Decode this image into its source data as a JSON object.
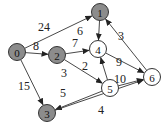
{
  "graph": {
    "nodes": [
      {
        "id": "0",
        "label": "0",
        "x": 17,
        "y": 52,
        "shaded": true
      },
      {
        "id": "1",
        "label": "1",
        "x": 100,
        "y": 12,
        "shaded": true
      },
      {
        "id": "2",
        "label": "2",
        "x": 57,
        "y": 55,
        "shaded": true
      },
      {
        "id": "3",
        "label": "3",
        "x": 47,
        "y": 113,
        "shaded": true
      },
      {
        "id": "4",
        "label": "4",
        "x": 98,
        "y": 49,
        "shaded": false
      },
      {
        "id": "5",
        "label": "5",
        "x": 110,
        "y": 88,
        "shaded": false
      },
      {
        "id": "6",
        "label": "6",
        "x": 152,
        "y": 77,
        "shaded": false
      }
    ],
    "edges": [
      {
        "from": "0",
        "to": "1",
        "weight": "24",
        "lx": 38,
        "ly": 31
      },
      {
        "from": "0",
        "to": "2",
        "weight": "8",
        "lx": 33,
        "ly": 50
      },
      {
        "from": "0",
        "to": "3",
        "weight": "15",
        "lx": 18,
        "ly": 90
      },
      {
        "from": "1",
        "to": "4",
        "weight": "6",
        "lx": 77,
        "ly": 35
      },
      {
        "from": "2",
        "to": "4",
        "weight": "7",
        "lx": 72,
        "ly": 47
      },
      {
        "from": "2",
        "to": "5",
        "weight": "3",
        "lx": 61,
        "ly": 77
      },
      {
        "from": "5",
        "to": "4",
        "weight": "2",
        "lx": 82,
        "ly": 70
      },
      {
        "from": "5",
        "to": "3",
        "weight": "5",
        "lx": 60,
        "ly": 97
      },
      {
        "from": "5",
        "to": "6",
        "weight": "10",
        "lx": 114,
        "ly": 83
      },
      {
        "from": "4",
        "to": "6",
        "weight": "9",
        "lx": 116,
        "ly": 66
      },
      {
        "from": "3",
        "to": "6",
        "weight": "4",
        "lx": 98,
        "ly": 114
      },
      {
        "from": "6",
        "to": "1",
        "weight": "3",
        "lx": 118,
        "ly": 40
      }
    ],
    "colors": {
      "shaded_fill": "#8c8c8c",
      "plain_fill": "#ffffff",
      "stroke": "#333333"
    }
  }
}
